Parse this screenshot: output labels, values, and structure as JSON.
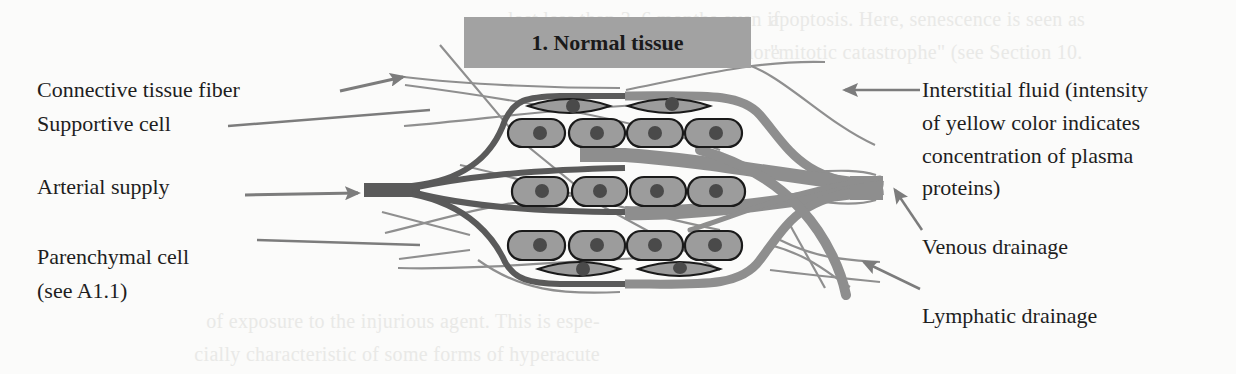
{
  "title": "1. Normal tissue",
  "left_labels": {
    "connective_tissue_fiber": "Connective tissue fiber",
    "supportive_cell": "Supportive cell",
    "arterial_supply": "Arterial supply",
    "parenchymal_cell": "Parenchymal cell",
    "parenchymal_cell_ref": "(see A1.1)"
  },
  "right_labels": {
    "interstitial_fluid_line1": "Interstitial fluid (intensity",
    "interstitial_fluid_line2": "of yellow color indicates",
    "interstitial_fluid_line3": "concentration of plasma",
    "interstitial_fluid_line4": "proteins)",
    "venous_drainage": "Venous drainage",
    "lymphatic_drainage": "Lymphatic drainage"
  },
  "background_bleed_text": {
    "top_right_1": "apoptosis. Here, senescence is seen as",
    "top_right_2": "\"mitotic catastrophe\" (see Section 10.",
    "top_mid_1": "lost less than 3–6 months even if",
    "top_mid_2": "ample, inflammations have more",
    "bottom_left_1": "of exposure to the injurious agent. This is espe-",
    "bottom_left_2": "cially characteristic of some forms of hyperacute"
  },
  "colors": {
    "title_box": "#a2a2a2",
    "arterial": "#5a5a5a",
    "venous": "#8e8e8e",
    "cell_fill": "#9c9c9c",
    "cell_stroke": "#1a1a1a",
    "nucleus": "#4a4a4a",
    "fiber": "#8a8a8a",
    "pointer_arrow": "#7c7c7c"
  }
}
